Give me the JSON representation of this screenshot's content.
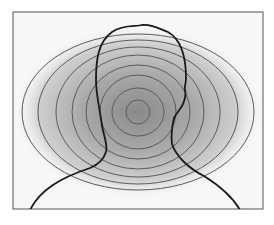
{
  "figure": {
    "frame": {
      "x": 13,
      "y": 12,
      "width": 250,
      "height": 197,
      "stroke": "#555555",
      "background": "#f7f7f7"
    },
    "glow": {
      "cx": 138,
      "cy": 112,
      "rx": 120,
      "ry": 82,
      "inner_color": "#8c8c8c",
      "outer_color": "#f4f4f4"
    },
    "rings": {
      "center": {
        "cx": 138,
        "cy": 112
      },
      "stroke": "#5a5a5a",
      "radii": [
        {
          "rx": 12,
          "ry": 12
        },
        {
          "rx": 26,
          "ry": 24
        },
        {
          "rx": 38,
          "ry": 37
        },
        {
          "rx": 52,
          "ry": 47
        },
        {
          "rx": 66,
          "ry": 57
        },
        {
          "rx": 82,
          "ry": 65
        },
        {
          "rx": 100,
          "ry": 72
        },
        {
          "rx": 116,
          "ry": 78
        }
      ]
    },
    "silhouette": {
      "stroke": "#1a1a1a",
      "label": "head-and-shoulders outline"
    }
  }
}
